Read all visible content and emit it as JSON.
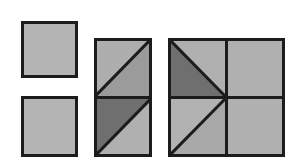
{
  "canvas": {
    "width": 301,
    "height": 164,
    "background_color": "#ffffff"
  },
  "palette": {
    "outline": "#1c1c1c",
    "light_gray": "#b4b4b4",
    "light_gray_alt": "#adadad",
    "mid_gray": "#9a9a9a",
    "dark_gray": "#6f6f6f",
    "dark_gray_alt": "#6a6a6a"
  },
  "style": {
    "outer_stroke_width": 3,
    "inner_stroke_width": 3,
    "diagonal_stroke_width": 3
  },
  "figures": [
    {
      "id": "figure-1",
      "name": "plain-square-top-left",
      "label": "Plain square, top left",
      "x": 21,
      "y": 21,
      "width": 57,
      "height": 57,
      "columns": 1,
      "rows": 1,
      "cells": [
        {
          "name": "cell-1",
          "row": 0,
          "col": 0,
          "divider": "none",
          "fill": "#b4b4b4",
          "fill_secondary": null
        }
      ]
    },
    {
      "id": "figure-2",
      "name": "plain-square-bottom-left",
      "label": "Plain square, bottom left",
      "x": 21,
      "y": 96,
      "width": 57,
      "height": 61,
      "columns": 1,
      "rows": 1,
      "cells": [
        {
          "name": "cell-1",
          "row": 0,
          "col": 0,
          "divider": "none",
          "fill": "#b4b4b4",
          "fill_secondary": null
        }
      ]
    },
    {
      "id": "figure-3",
      "name": "two-cell-rectangle-middle",
      "label": "Two-cell rectangle with diagonals, middle",
      "x": 94,
      "y": 38,
      "width": 58,
      "height": 119,
      "columns": 1,
      "rows": 2,
      "cells": [
        {
          "name": "cell-top",
          "row": 0,
          "col": 0,
          "divider": "bl-tr",
          "fill": "#aeaeae",
          "fill_secondary": "#9b9b9b",
          "dark_half": "none"
        },
        {
          "name": "cell-bottom",
          "row": 1,
          "col": 0,
          "divider": "bl-tr",
          "fill": "#b0b0b0",
          "fill_secondary": "#6f6f6f",
          "dark_half": "upper-right"
        }
      ]
    },
    {
      "id": "figure-4",
      "name": "four-cell-square-right",
      "label": "Four-cell square with diagonals, right",
      "x": 168,
      "y": 38,
      "width": 117,
      "height": 119,
      "columns": 2,
      "rows": 2,
      "cells": [
        {
          "name": "cell-top-left",
          "row": 0,
          "col": 0,
          "divider": "tl-br",
          "fill": "#b0b0b0",
          "fill_secondary": "#6f6f6f",
          "dark_half": "lower-left"
        },
        {
          "name": "cell-top-right",
          "row": 0,
          "col": 1,
          "divider": "none",
          "fill": "#b0b0b0",
          "fill_secondary": null,
          "dark_half": "none"
        },
        {
          "name": "cell-bottom-left",
          "row": 1,
          "col": 0,
          "divider": "bl-tr",
          "fill": "#b2b2b2",
          "fill_secondary": "#a9a9a9",
          "dark_half": "none"
        },
        {
          "name": "cell-bottom-right",
          "row": 1,
          "col": 1,
          "divider": "none",
          "fill": "#b0b0b0",
          "fill_secondary": null,
          "dark_half": "none"
        }
      ]
    }
  ]
}
